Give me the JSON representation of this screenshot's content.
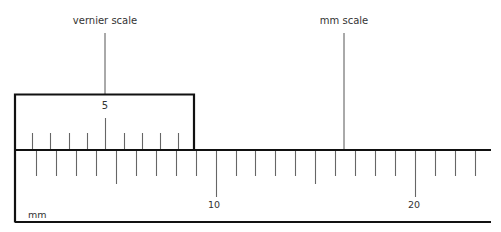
{
  "diagram": {
    "labels": {
      "vernier_scale": "vernier scale",
      "mm_scale": "mm scale",
      "unit": "mm",
      "vernier_mark": "5",
      "main_marks": [
        "10",
        "20"
      ]
    },
    "main_scale": {
      "unit": "mm",
      "tick_spacing_px": 19.95,
      "first_tick_x": 36,
      "tick_count": 23,
      "labeled_ticks": [
        {
          "index": 9,
          "label": "10"
        },
        {
          "index": 19,
          "label": "20"
        }
      ],
      "medium_ticks": [
        4,
        14
      ]
    },
    "vernier_scale": {
      "tick_count": 9,
      "first_tick_x": 32,
      "tick_spacing_px": 18.3,
      "labeled_ticks": [
        {
          "index": 4,
          "label": "5"
        }
      ]
    },
    "colors": {
      "frame": "#111111",
      "ticks": "#666666",
      "text": "#333333",
      "background": "#ffffff"
    }
  }
}
